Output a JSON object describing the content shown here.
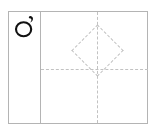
{
  "document": {
    "type": "handwriting-practice-grid",
    "title": "Character practice row",
    "character_cell": {
      "glyph_name": "circle-with-apostrophe-stroke-glyph",
      "glyph_text": "",
      "stroke_color": "#111111"
    },
    "practice_box": {
      "guides": [
        {
          "name": "vertical-center-guide",
          "style": "dashed"
        },
        {
          "name": "horizontal-center-guide",
          "style": "dashed"
        },
        {
          "name": "diamond-guide",
          "style": "dashed"
        }
      ]
    },
    "colors": {
      "frame_border": "#b4b4b4",
      "guide_line": "#c2c2c2",
      "background": "#ffffff",
      "ink": "#111111"
    }
  }
}
